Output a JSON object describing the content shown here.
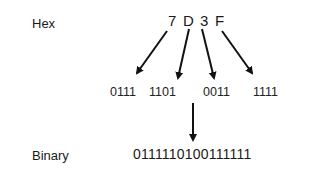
{
  "labels": {
    "hex": "Hex",
    "binary": "Binary"
  },
  "hex_digits": [
    "7",
    "D",
    "3",
    "F"
  ],
  "nibbles": [
    "0111",
    "1101",
    "0011",
    "1111"
  ],
  "binary_result": "0111110100111111",
  "colors": {
    "text": "#1a1a1a",
    "arrow": "#111111",
    "background": "#ffffff"
  }
}
